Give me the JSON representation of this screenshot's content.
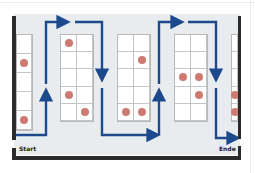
{
  "labels": {
    "start": "Start",
    "end": "Ende"
  },
  "colors": {
    "path": "#1d4a8c",
    "pick_dot": "#cd7b72",
    "wall": "#2b2b2b",
    "floor": "#e9ecef"
  },
  "racks": [
    {
      "id": "rack-0",
      "x": 16,
      "y": 34,
      "w": 17,
      "h": 97,
      "cols": 1,
      "rows": 5,
      "picks": [
        [
          1,
          0
        ],
        [
          4,
          0
        ]
      ]
    },
    {
      "id": "rack-1",
      "x": 60,
      "y": 34,
      "w": 34,
      "h": 88,
      "cols": 2,
      "rows": 5,
      "picks": [
        [
          0,
          0
        ],
        [
          3,
          0
        ],
        [
          4,
          1
        ]
      ]
    },
    {
      "id": "rack-2",
      "x": 117,
      "y": 34,
      "w": 34,
      "h": 88,
      "cols": 2,
      "rows": 5,
      "picks": [
        [
          1,
          1
        ],
        [
          4,
          0
        ],
        [
          4,
          1
        ]
      ]
    },
    {
      "id": "rack-3",
      "x": 174,
      "y": 34,
      "w": 34,
      "h": 88,
      "cols": 2,
      "rows": 5,
      "picks": [
        [
          2,
          0
        ],
        [
          2,
          1
        ],
        [
          3,
          1
        ]
      ]
    },
    {
      "id": "rack-4",
      "x": 231,
      "y": 34,
      "w": 8,
      "h": 88,
      "cols": 1,
      "rows": 5,
      "picks": [
        [
          3,
          0
        ],
        [
          4,
          0
        ]
      ]
    }
  ]
}
